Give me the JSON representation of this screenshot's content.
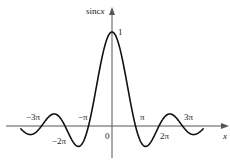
{
  "chart_data": {
    "type": "line",
    "title": "",
    "function": "sinc x = sin(x)/x",
    "xlabel": "x",
    "ylabel": "sincx",
    "x_ticks": [
      "-3π",
      "-2π",
      "-π",
      "0",
      "π",
      "2π",
      "3π"
    ],
    "y_ticks": [
      "1"
    ],
    "xlim": [
      -3.9,
      3.9
    ],
    "ylim_note": "units of π on x-axis",
    "series": [
      {
        "name": "sinc x",
        "x": [
          -3.75,
          -3.5,
          -3.0,
          -2.5,
          -2.0,
          -1.5,
          -1.0,
          -0.5,
          0.0,
          0.5,
          1.0,
          1.5,
          2.0,
          2.5,
          3.0,
          3.5,
          3.75
        ],
        "values": [
          0.06,
          -0.091,
          0.0,
          0.127,
          0.0,
          -0.212,
          0.0,
          0.637,
          1.0,
          0.637,
          0.0,
          -0.212,
          0.0,
          0.127,
          0.0,
          -0.091,
          0.06
        ]
      }
    ],
    "grid": false,
    "legend": "none"
  },
  "labels": {
    "ylabel_text": "sinc",
    "ylabel_var": "x",
    "xlabel": "x",
    "peak": "1",
    "origin": "0",
    "neg3pi": "−3π",
    "neg2pi": "−2π",
    "negpi": "−π",
    "pi": "π",
    "twopi": "2π",
    "threepi": "3π"
  }
}
